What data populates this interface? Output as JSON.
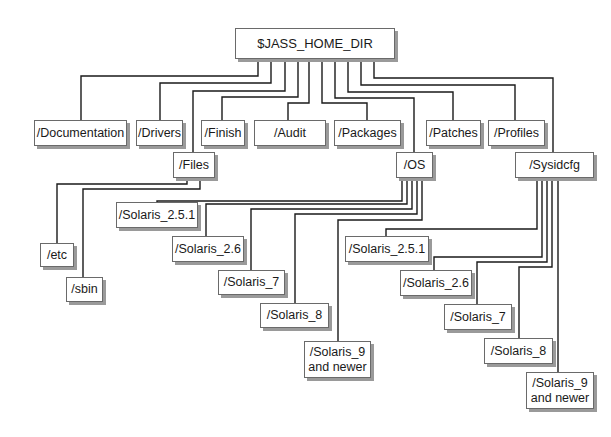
{
  "diagram": {
    "line_color": "#1a1a1a",
    "box_border_color": "#6a6a6a",
    "box_shadow_color": "#9a9a9a",
    "nodes": [
      {
        "id": "root",
        "label": "$JASS_HOME_DIR",
        "x": 235,
        "y": 28,
        "w": 160,
        "h": 31
      },
      {
        "id": "documentation",
        "label": "/Documentation",
        "x": 34,
        "y": 120,
        "w": 93,
        "h": 26
      },
      {
        "id": "drivers",
        "label": "/Drivers",
        "x": 136,
        "y": 120,
        "w": 47,
        "h": 26
      },
      {
        "id": "finish",
        "label": "/Finish",
        "x": 201,
        "y": 120,
        "w": 44,
        "h": 26
      },
      {
        "id": "audit",
        "label": "/Audit",
        "x": 254,
        "y": 120,
        "w": 72,
        "h": 26
      },
      {
        "id": "packages",
        "label": "/Packages",
        "x": 334,
        "y": 120,
        "w": 67,
        "h": 26
      },
      {
        "id": "patches",
        "label": "/Patches",
        "x": 426,
        "y": 120,
        "w": 55,
        "h": 26
      },
      {
        "id": "profiles",
        "label": "/Profiles",
        "x": 488,
        "y": 120,
        "w": 57,
        "h": 26
      },
      {
        "id": "files",
        "label": "/Files",
        "x": 173,
        "y": 152,
        "w": 42,
        "h": 26
      },
      {
        "id": "os",
        "label": "/OS",
        "x": 396,
        "y": 152,
        "w": 37,
        "h": 26
      },
      {
        "id": "sysidcfg",
        "label": "/Sysidcfg",
        "x": 515,
        "y": 152,
        "w": 79,
        "h": 26
      },
      {
        "id": "etc",
        "label": "/etc",
        "x": 40,
        "y": 243,
        "w": 34,
        "h": 24
      },
      {
        "id": "sbin",
        "label": "/sbin",
        "x": 66,
        "y": 277,
        "w": 37,
        "h": 25
      },
      {
        "id": "os_s251",
        "label": "/Solaris_2.5.1",
        "x": 116,
        "y": 202,
        "w": 82,
        "h": 26
      },
      {
        "id": "os_s26",
        "label": "/Solaris_2.6",
        "x": 172,
        "y": 236,
        "w": 72,
        "h": 26
      },
      {
        "id": "os_s7",
        "label": "/Solaris_7",
        "x": 218,
        "y": 270,
        "w": 67,
        "h": 25
      },
      {
        "id": "os_s8",
        "label": "/Solaris_8",
        "x": 260,
        "y": 303,
        "w": 69,
        "h": 25
      },
      {
        "id": "os_s9",
        "label": "/Solaris_9\nand newer",
        "x": 304,
        "y": 341,
        "w": 67,
        "h": 37
      },
      {
        "id": "sy_s251",
        "label": "/Solaris_2.5.1",
        "x": 345,
        "y": 236,
        "w": 84,
        "h": 26
      },
      {
        "id": "sy_s26",
        "label": "/Solaris_2.6",
        "x": 400,
        "y": 270,
        "w": 72,
        "h": 26
      },
      {
        "id": "sy_s7",
        "label": "/Solaris_7",
        "x": 444,
        "y": 304,
        "w": 68,
        "h": 26
      },
      {
        "id": "sy_s8",
        "label": "/Solaris_8",
        "x": 484,
        "y": 338,
        "w": 69,
        "h": 26
      },
      {
        "id": "sy_s9",
        "label": "/Solaris_9\nand newer",
        "x": 526,
        "y": 372,
        "w": 68,
        "h": 37
      }
    ],
    "connectors": [
      {
        "from": "root",
        "to": "documentation",
        "points": [
          [
            258,
            59
          ],
          [
            258,
            76
          ],
          [
            81,
            76
          ],
          [
            81,
            120
          ]
        ]
      },
      {
        "from": "root",
        "to": "drivers",
        "points": [
          [
            271,
            59
          ],
          [
            271,
            83
          ],
          [
            160,
            83
          ],
          [
            160,
            120
          ]
        ]
      },
      {
        "from": "root",
        "to": "files",
        "points": [
          [
            285,
            59
          ],
          [
            285,
            91
          ],
          [
            193,
            91
          ],
          [
            193,
            152
          ]
        ]
      },
      {
        "from": "root",
        "to": "finish",
        "points": [
          [
            298,
            59
          ],
          [
            298,
            97
          ],
          [
            222,
            97
          ],
          [
            222,
            120
          ]
        ]
      },
      {
        "from": "root",
        "to": "audit",
        "points": [
          [
            309,
            59
          ],
          [
            309,
            103
          ],
          [
            288,
            103
          ],
          [
            288,
            120
          ]
        ]
      },
      {
        "from": "root",
        "to": "packages",
        "points": [
          [
            322,
            59
          ],
          [
            322,
            103
          ],
          [
            367,
            103
          ],
          [
            367,
            120
          ]
        ]
      },
      {
        "from": "root",
        "to": "os",
        "points": [
          [
            335,
            59
          ],
          [
            335,
            98
          ],
          [
            414,
            98
          ],
          [
            414,
            152
          ]
        ]
      },
      {
        "from": "root",
        "to": "patches",
        "points": [
          [
            348,
            59
          ],
          [
            348,
            92
          ],
          [
            453,
            92
          ],
          [
            453,
            120
          ]
        ]
      },
      {
        "from": "root",
        "to": "profiles",
        "points": [
          [
            361,
            59
          ],
          [
            361,
            85
          ],
          [
            515,
            85
          ],
          [
            515,
            120
          ]
        ]
      },
      {
        "from": "root",
        "to": "sysidcfg",
        "points": [
          [
            374,
            59
          ],
          [
            374,
            78
          ],
          [
            553,
            78
          ],
          [
            553,
            152
          ]
        ]
      },
      {
        "from": "files",
        "to": "etc",
        "points": [
          [
            187,
            178
          ],
          [
            187,
            184
          ],
          [
            57,
            184
          ],
          [
            57,
            243
          ]
        ]
      },
      {
        "from": "files",
        "to": "sbin",
        "points": [
          [
            200,
            178
          ],
          [
            200,
            189
          ],
          [
            83,
            189
          ],
          [
            83,
            277
          ]
        ]
      },
      {
        "from": "os",
        "to": "os_s251",
        "points": [
          [
            402,
            178
          ],
          [
            402,
            201
          ],
          [
            157,
            201
          ],
          [
            157,
            202
          ]
        ]
      },
      {
        "from": "os",
        "to": "os_s26",
        "points": [
          [
            407,
            178
          ],
          [
            407,
            204
          ],
          [
            206,
            204
          ],
          [
            206,
            236
          ]
        ]
      },
      {
        "from": "os",
        "to": "os_s7",
        "points": [
          [
            412,
            178
          ],
          [
            412,
            209
          ],
          [
            251,
            209
          ],
          [
            251,
            270
          ]
        ]
      },
      {
        "from": "os",
        "to": "os_s8",
        "points": [
          [
            417,
            178
          ],
          [
            417,
            214
          ],
          [
            295,
            214
          ],
          [
            295,
            303
          ]
        ]
      },
      {
        "from": "os",
        "to": "os_s9",
        "points": [
          [
            422,
            178
          ],
          [
            422,
            220
          ],
          [
            338,
            220
          ],
          [
            338,
            341
          ]
        ]
      },
      {
        "from": "sysidcfg",
        "to": "sy_s251",
        "points": [
          [
            537,
            178
          ],
          [
            537,
            229
          ],
          [
            386,
            229
          ],
          [
            386,
            236
          ]
        ]
      },
      {
        "from": "sysidcfg",
        "to": "sy_s26",
        "points": [
          [
            542,
            178
          ],
          [
            542,
            257
          ],
          [
            434,
            257
          ],
          [
            434,
            270
          ]
        ]
      },
      {
        "from": "sysidcfg",
        "to": "sy_s7",
        "points": [
          [
            547,
            178
          ],
          [
            547,
            262
          ],
          [
            477,
            262
          ],
          [
            477,
            304
          ]
        ]
      },
      {
        "from": "sysidcfg",
        "to": "sy_s8",
        "points": [
          [
            552,
            178
          ],
          [
            552,
            267
          ],
          [
            519,
            267
          ],
          [
            519,
            338
          ]
        ]
      },
      {
        "from": "sysidcfg",
        "to": "sy_s9",
        "points": [
          [
            558,
            178
          ],
          [
            558,
            372
          ]
        ]
      }
    ]
  }
}
